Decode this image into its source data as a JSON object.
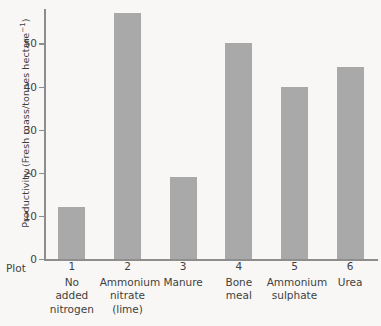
{
  "chart_data": {
    "type": "bar",
    "title": "",
    "subtitle": "",
    "xlabel": "Plot",
    "ylabel": "Productivity (Fresh mass/tonnes hectare⁻¹)",
    "ylabel_main": "Productivity (Fresh mass/tonnes hectare",
    "ylabel_sup": "−1",
    "ylabel_close": ")",
    "categories": [
      "1",
      "2",
      "3",
      "4",
      "5",
      "6"
    ],
    "category_names": [
      "No added nitrogen",
      "Ammonium nitrate (lime)",
      "Manure",
      "Bone meal",
      "Ammonium sulphate",
      "Urea"
    ],
    "values": [
      12,
      57,
      19,
      50,
      40,
      44.5
    ],
    "ylim": [
      0,
      58
    ],
    "yticks": [
      0,
      10,
      20,
      30,
      40,
      50
    ],
    "ytick_labels": [
      "0",
      "10",
      "20",
      "30",
      "40",
      "50"
    ],
    "grid": false,
    "legend": false,
    "bar_color": "#a9a9a9",
    "axis_color": "#8d8d8d",
    "background_color": "#f8f7f5",
    "text_color": "#3f3f3f"
  },
  "xaxis_label_lines": [
    [
      "No",
      "added",
      "nitrogen"
    ],
    [
      "Ammonium",
      "nitrate",
      "(lime)"
    ],
    [
      "Manure"
    ],
    [
      "Bone",
      "meal"
    ],
    [
      "Ammonium",
      "sulphate"
    ],
    [
      "Urea"
    ]
  ],
  "plot_word": "Plot"
}
